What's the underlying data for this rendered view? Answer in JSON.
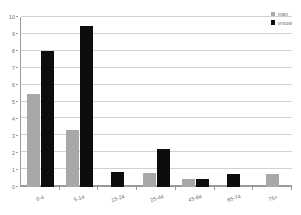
{
  "chart_data": {
    "type": "bar",
    "title": "",
    "subtitle": "",
    "xlabel": "",
    "ylabel": "",
    "ylim": [
      0,
      10
    ],
    "ytick_step": 1,
    "yticks": [
      "0",
      "1",
      "2",
      "3",
      "4",
      "5",
      "6",
      "7",
      "8",
      "9",
      "10"
    ],
    "grid": true,
    "grid_axis": "y",
    "legend_position": "top-right",
    "categories": [
      "0-4",
      "5-14",
      "15-24",
      "25-44",
      "45-64",
      "65-74",
      "75+"
    ],
    "series": [
      {
        "name": "man",
        "color": "#a8a8a8",
        "values": [
          5.5,
          3.35,
          0,
          0.8,
          0.45,
          0,
          0.75
        ]
      },
      {
        "name": "vrouw",
        "color": "#0d0d0d",
        "values": [
          8.0,
          9.5,
          0.9,
          2.25,
          0.45,
          0.75,
          0
        ]
      }
    ]
  },
  "legend": {
    "items": [
      {
        "label": "man",
        "swatch_class": "men"
      },
      {
        "label": "vrouw",
        "swatch_class": "women"
      }
    ]
  },
  "colors": {
    "men": "#a8a8a8",
    "women": "#0d0d0d",
    "grid": "#d2d2d2",
    "axis": "#9a9a9a",
    "text": "#6d6d6d",
    "background": "#ffffff"
  }
}
